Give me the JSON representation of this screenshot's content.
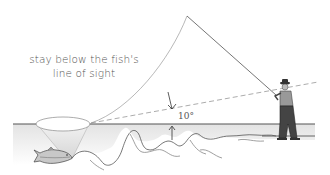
{
  "diagram": {
    "caption_line1": "stay below the fish's",
    "caption_line2": "line of sight",
    "angle_label": "10°",
    "colors": {
      "water_surface": "#555555",
      "water_fill_top": "#e6e6e6",
      "water_fill_bottom": "#ffffff",
      "line_stroke": "#999999",
      "text": "#555555",
      "cone_fill": "#dddddd"
    },
    "elements": [
      "fish",
      "window-ellipse",
      "vision-cone",
      "water-surface",
      "riverbed",
      "fly-rod",
      "fly-line",
      "line-of-sight-dashed",
      "angle-arrows",
      "angler"
    ]
  }
}
